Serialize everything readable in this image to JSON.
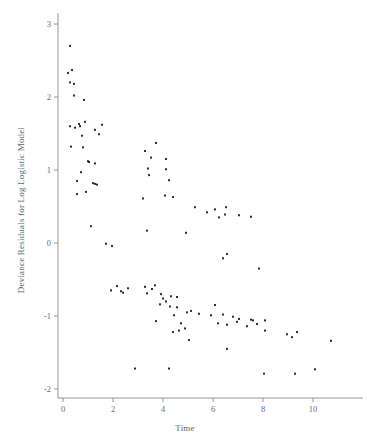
{
  "chart_data": {
    "type": "scatter",
    "title": "",
    "xlabel": "Time",
    "ylabel": "Deviance Residuals for Log Logistic Model",
    "xlim": [
      -0.6,
      12.0
    ],
    "ylim": [
      -2.35,
      3.15
    ],
    "xticks": [
      0,
      2,
      4,
      6,
      8,
      10
    ],
    "xticklabels": [
      "0",
      "2",
      "4",
      "6",
      "8",
      "10"
    ],
    "yticks": [
      3,
      2,
      1,
      0,
      -1,
      -2
    ],
    "yticklabels": [
      "3",
      "2",
      "1",
      "0",
      "-1",
      "-2"
    ],
    "grid": false,
    "legend": null,
    "marker": "square",
    "marker_size": 2.0,
    "marker_color": "#2b2b2b",
    "n_points": 105,
    "points": [
      [
        0.28,
        2.7
      ],
      [
        0.2,
        2.33
      ],
      [
        0.36,
        2.37
      ],
      [
        0.28,
        2.2
      ],
      [
        0.44,
        2.18
      ],
      [
        0.44,
        2.02
      ],
      [
        0.84,
        1.96
      ],
      [
        0.28,
        1.6
      ],
      [
        0.68,
        1.6
      ],
      [
        0.88,
        1.66
      ],
      [
        1.56,
        1.62
      ],
      [
        1.28,
        1.55
      ],
      [
        0.76,
        1.47
      ],
      [
        1.44,
        1.49
      ],
      [
        0.32,
        1.32
      ],
      [
        0.8,
        1.31
      ],
      [
        3.28,
        1.26
      ],
      [
        3.72,
        1.37
      ],
      [
        3.52,
        1.17
      ],
      [
        4.12,
        1.15
      ],
      [
        1.04,
        1.11
      ],
      [
        1.28,
        1.09
      ],
      [
        3.4,
        1.02
      ],
      [
        4.12,
        1.01
      ],
      [
        0.72,
        0.97
      ],
      [
        0.56,
        0.85
      ],
      [
        1.2,
        0.82
      ],
      [
        1.28,
        0.81
      ],
      [
        0.56,
        0.67
      ],
      [
        3.2,
        0.61
      ],
      [
        4.08,
        0.65
      ],
      [
        4.4,
        0.63
      ],
      [
        5.28,
        0.49
      ],
      [
        6.08,
        0.46
      ],
      [
        6.52,
        0.49
      ],
      [
        6.24,
        0.35
      ],
      [
        6.48,
        0.39
      ],
      [
        7.04,
        0.38
      ],
      [
        7.52,
        0.36
      ],
      [
        1.12,
        0.23
      ],
      [
        3.36,
        0.17
      ],
      [
        4.92,
        0.14
      ],
      [
        1.72,
        -0.01
      ],
      [
        1.96,
        -0.04
      ],
      [
        6.56,
        -0.15
      ],
      [
        6.4,
        -0.21
      ],
      [
        7.84,
        -0.35
      ],
      [
        2.16,
        -0.59
      ],
      [
        3.28,
        -0.6
      ],
      [
        3.68,
        -0.58
      ],
      [
        1.92,
        -0.65
      ],
      [
        2.4,
        -0.68
      ],
      [
        3.36,
        -0.69
      ],
      [
        4.0,
        -0.76
      ],
      [
        4.32,
        -0.73
      ],
      [
        4.56,
        -0.74
      ],
      [
        3.88,
        -0.84
      ],
      [
        4.28,
        -0.87
      ],
      [
        4.56,
        -0.88
      ],
      [
        6.08,
        -0.85
      ],
      [
        4.96,
        -0.95
      ],
      [
        5.44,
        -0.97
      ],
      [
        6.4,
        -0.98
      ],
      [
        6.8,
        -1.01
      ],
      [
        7.04,
        -1.04
      ],
      [
        7.52,
        -1.05
      ],
      [
        7.6,
        -1.06
      ],
      [
        3.72,
        -1.07
      ],
      [
        6.2,
        -1.1
      ],
      [
        6.56,
        -1.12
      ],
      [
        7.36,
        -1.14
      ],
      [
        8.08,
        -1.06
      ],
      [
        4.4,
        -1.22
      ],
      [
        4.64,
        -1.2
      ],
      [
        4.88,
        -1.17
      ],
      [
        8.08,
        -1.2
      ],
      [
        9.36,
        -1.22
      ],
      [
        9.16,
        -1.29
      ],
      [
        10.72,
        -1.34
      ],
      [
        5.04,
        -1.33
      ],
      [
        6.56,
        -1.45
      ],
      [
        2.88,
        -1.72
      ],
      [
        4.24,
        -1.72
      ],
      [
        10.08,
        -1.73
      ],
      [
        8.04,
        -1.79
      ],
      [
        9.28,
        -1.79
      ],
      [
        0.64,
        1.63
      ],
      [
        1.0,
        1.12
      ],
      [
        3.44,
        0.93
      ],
      [
        4.24,
        0.86
      ],
      [
        5.76,
        0.42
      ],
      [
        2.6,
        -0.62
      ],
      [
        3.56,
        -0.63
      ],
      [
        4.12,
        -0.8
      ],
      [
        5.12,
        -0.93
      ],
      [
        5.92,
        -0.99
      ],
      [
        6.96,
        -1.08
      ],
      [
        7.76,
        -1.11
      ],
      [
        8.96,
        -1.25
      ],
      [
        4.72,
        -1.1
      ],
      [
        4.44,
        -0.99
      ],
      [
        3.92,
        -0.7
      ],
      [
        2.32,
        -0.66
      ],
      [
        1.36,
        0.8
      ],
      [
        0.92,
        0.7
      ],
      [
        0.48,
        1.58
      ]
    ]
  },
  "axes": {
    "x_axis_name": "x-axis",
    "y_axis_name": "y-axis"
  }
}
